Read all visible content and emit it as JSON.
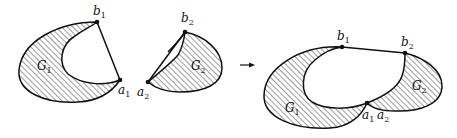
{
  "figure": {
    "left_region": {
      "name": "G",
      "sub": "1",
      "points": [
        {
          "name": "b",
          "sub": "1"
        },
        {
          "name": "a",
          "sub": "1"
        }
      ]
    },
    "middle_region": {
      "name": "G",
      "sub": "2",
      "points": [
        {
          "name": "b",
          "sub": "2"
        },
        {
          "name": "a",
          "sub": "2"
        }
      ]
    },
    "arrow": "→",
    "result": {
      "regions": [
        {
          "name": "G",
          "sub": "1"
        },
        {
          "name": "G",
          "sub": "2"
        }
      ],
      "points": [
        {
          "name": "b",
          "sub": "1"
        },
        {
          "name": "b",
          "sub": "2"
        },
        {
          "name": "a",
          "sub": "1"
        },
        {
          "name": "a",
          "sub": "2"
        }
      ]
    },
    "colors": {
      "stroke": "#111111",
      "background": "#ffffff"
    }
  }
}
